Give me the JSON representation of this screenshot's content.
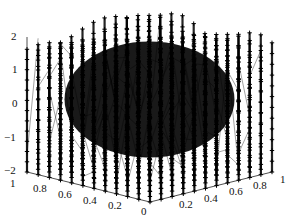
{
  "chart_data": {
    "type": "scatter",
    "subtype": "3d-line-with-markers",
    "title": "",
    "xlabel": "",
    "ylabel": "",
    "zlabel": "",
    "marker": "+",
    "line_color": "#000000",
    "x_range": [
      0,
      1
    ],
    "y_range": [
      0,
      1
    ],
    "z_range": [
      -2,
      2
    ],
    "grid": false,
    "legend": null,
    "grid_points_per_axis": 12,
    "z_ticks": [
      "2",
      "1",
      "0",
      "-1",
      "-2"
    ],
    "x_ticks": [
      "1",
      "0.8",
      "0.6",
      "0.4",
      "0.2",
      "0"
    ],
    "y_ticks": [
      "0.2",
      "0.4",
      "0.6",
      "0.8",
      "1"
    ]
  },
  "labels": {
    "z": [
      {
        "text": "2",
        "x": 11,
        "y": 31
      },
      {
        "text": "1",
        "x": 12,
        "y": 64
      },
      {
        "text": "0",
        "x": 12,
        "y": 98
      },
      {
        "text": "−1",
        "x": 4,
        "y": 132
      },
      {
        "text": "−2",
        "x": 4,
        "y": 165
      }
    ],
    "x": [
      {
        "text": "1",
        "x": 10,
        "y": 178
      },
      {
        "text": "0.8",
        "x": 33,
        "y": 183
      },
      {
        "text": "0.6",
        "x": 58,
        "y": 189
      },
      {
        "text": "0.4",
        "x": 83,
        "y": 195
      },
      {
        "text": "0.2",
        "x": 108,
        "y": 200
      },
      {
        "text": "0",
        "x": 141,
        "y": 206
      }
    ],
    "y": [
      {
        "text": "0.2",
        "x": 179,
        "y": 199
      },
      {
        "text": "0.4",
        "x": 204,
        "y": 193
      },
      {
        "text": "0.6",
        "x": 229,
        "y": 186
      },
      {
        "text": "0.8",
        "x": 253,
        "y": 180
      },
      {
        "text": "1",
        "x": 280,
        "y": 174
      }
    ]
  }
}
